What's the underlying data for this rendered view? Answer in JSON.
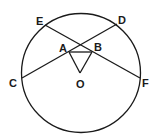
{
  "diagram": {
    "type": "geometry",
    "circle": {
      "center_label": "O"
    },
    "labels": {
      "E": "E",
      "D": "D",
      "C": "C",
      "F": "F",
      "A": "A",
      "B": "B",
      "O": "O"
    },
    "segments": [
      "CD",
      "EF",
      "AB",
      "OA",
      "OB"
    ]
  }
}
